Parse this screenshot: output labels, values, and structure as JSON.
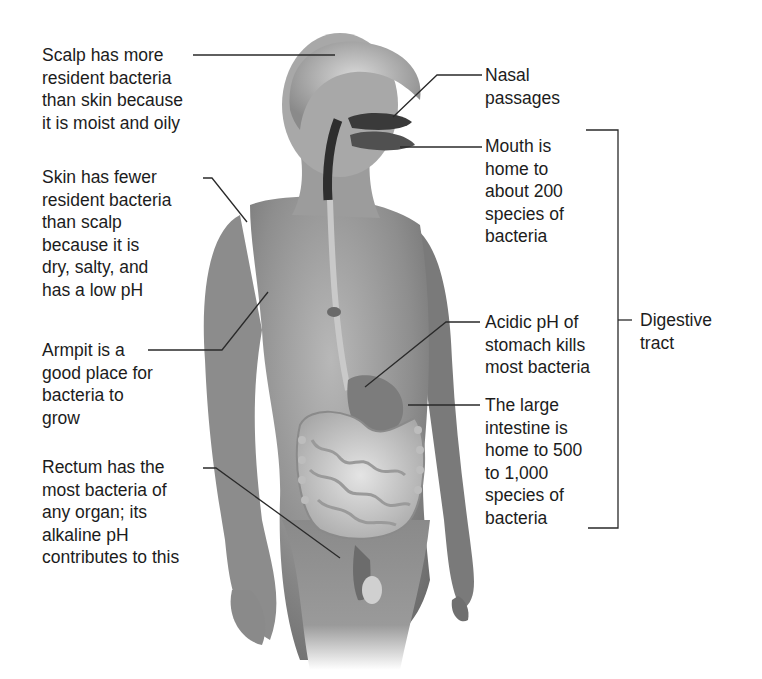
{
  "figure": {
    "labels_left": [
      {
        "id": "scalp",
        "text": "Scalp has more\nresident bacteria\nthan skin because\nit is moist and oily"
      },
      {
        "id": "skin",
        "text": "Skin has fewer\nresident bacteria\nthan scalp\nbecause it is\ndry, salty, and\nhas a low pH"
      },
      {
        "id": "armpit",
        "text": "Armpit is a\ngood place for\nbacteria to\ngrow"
      },
      {
        "id": "rectum",
        "text": "Rectum has the\nmost bacteria of\nany organ; its\nalkaline pH\ncontributes to this"
      }
    ],
    "labels_right": [
      {
        "id": "nasal",
        "text": "Nasal\npassages"
      },
      {
        "id": "mouth",
        "text": "Mouth is\nhome to\nabout 200\nspecies of\nbacteria"
      },
      {
        "id": "stomach",
        "text": "Acidic pH of\nstomach kills\nmost bacteria"
      },
      {
        "id": "large-intestine",
        "text": "The large\nintestine is\nhome to 500\nto 1,000\nspecies of\nbacteria"
      }
    ],
    "bracket_label": "Digestive\ntract",
    "colors": {
      "background": "#ffffff",
      "text": "#1c1c1c",
      "skin_dark": "#6e6e6e",
      "skin_mid": "#9a9a9a",
      "skin_light": "#c8c8c8",
      "organ": "#d2d2d2",
      "leader_line": "#2a2a2a"
    }
  }
}
